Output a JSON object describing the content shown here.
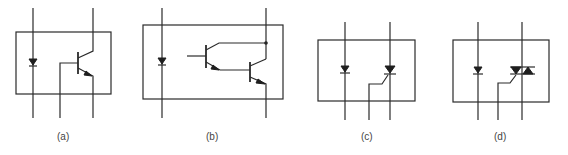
{
  "figure": {
    "panels": [
      {
        "id": "a",
        "label": "(a)",
        "type": "phototransistor"
      },
      {
        "id": "b",
        "label": "(b)",
        "type": "photo-darlington"
      },
      {
        "id": "c",
        "label": "(c)",
        "type": "photo-SCR"
      },
      {
        "id": "d",
        "label": "(d)",
        "type": "photo-triac"
      }
    ]
  }
}
